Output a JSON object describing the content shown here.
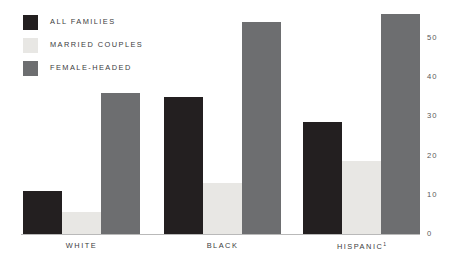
{
  "chart_data": {
    "type": "bar",
    "title": "",
    "subtitle": "",
    "xlabel": "",
    "ylabel": "",
    "ylim": [
      0,
      57
    ],
    "grid": false,
    "legend_position": "top-left",
    "categories": [
      "WHITE",
      "BLACK",
      "HISPANIC"
    ],
    "category_footnotes": [
      "",
      "",
      "1"
    ],
    "ytick_labels": [
      "0",
      "10",
      "20",
      "30",
      "40",
      "50"
    ],
    "ytick_values": [
      0,
      10,
      20,
      30,
      40,
      50
    ],
    "series": [
      {
        "name": "ALL FAMILIES",
        "color": "#231f20",
        "values": [
          11.0,
          35.0,
          28.5
        ]
      },
      {
        "name": "MARRIED COUPLES",
        "color": "#e8e7e4",
        "values": [
          5.5,
          13.0,
          18.5
        ]
      },
      {
        "name": "FEMALE-HEADED",
        "color": "#6d6e70",
        "values": [
          36.0,
          54.0,
          56.0
        ]
      }
    ]
  },
  "legend": {
    "items": [
      {
        "label": "ALL FAMILIES",
        "color": "#231f20"
      },
      {
        "label": "MARRIED COUPLES",
        "color": "#e8e7e4"
      },
      {
        "label": "FEMALE-HEADED",
        "color": "#6d6e70"
      }
    ]
  },
  "axis": {
    "ticks": [
      {
        "label": "50",
        "value": 50
      },
      {
        "label": "40",
        "value": 40
      },
      {
        "label": "30",
        "value": 30
      },
      {
        "label": "20",
        "value": 20
      },
      {
        "label": "10",
        "value": 10
      },
      {
        "label": "0",
        "value": 0
      }
    ]
  },
  "groups": [
    {
      "label": "WHITE",
      "footnote": ""
    },
    {
      "label": "BLACK",
      "footnote": ""
    },
    {
      "label": "HISPANIC",
      "footnote": "1"
    }
  ]
}
